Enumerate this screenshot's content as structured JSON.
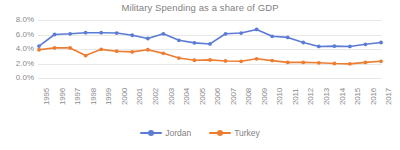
{
  "chart_data": {
    "type": "line",
    "title": "Military Spending as a share of GDP",
    "xlabel": "",
    "ylabel": "",
    "ylim": [
      0,
      8
    ],
    "yticks": [
      "0.0%",
      "2.0%",
      "4.0%",
      "6.0%",
      "8.0%"
    ],
    "ytick_values": [
      0,
      2,
      4,
      6,
      8
    ],
    "grid": true,
    "legend_position": "bottom",
    "categories": [
      "1995",
      "1996",
      "1997",
      "1998",
      "1999",
      "2000",
      "2001",
      "2002",
      "2003",
      "2004",
      "2005",
      "2006",
      "2007",
      "2008",
      "2009",
      "2010",
      "2011",
      "2012",
      "2013",
      "2014",
      "2015",
      "2016",
      "2017"
    ],
    "series": [
      {
        "name": "Jordan",
        "color": "#5B7BD5",
        "marker": "circle",
        "values": [
          4.4,
          6.0,
          6.1,
          6.25,
          6.25,
          6.2,
          5.9,
          5.45,
          6.1,
          5.2,
          4.85,
          4.7,
          6.1,
          6.2,
          6.7,
          5.75,
          5.6,
          4.9,
          4.35,
          4.4,
          4.35,
          4.65,
          4.9
        ]
      },
      {
        "name": "Turkey",
        "color": "#ED7D31",
        "marker": "circle",
        "values": [
          3.9,
          4.15,
          4.15,
          3.1,
          3.95,
          3.7,
          3.6,
          3.9,
          3.4,
          2.75,
          2.45,
          2.5,
          2.35,
          2.3,
          2.65,
          2.4,
          2.15,
          2.15,
          2.1,
          2.0,
          1.95,
          2.15,
          2.3
        ]
      }
    ]
  },
  "legend": {
    "entries": [
      {
        "label": "Jordan"
      },
      {
        "label": "Turkey"
      }
    ]
  },
  "colors": {
    "jordan": "#5B7BD5",
    "turkey": "#ED7D31",
    "gridline": "#e8e8e8",
    "text": "#7f7f7f",
    "background": "#ffffff"
  }
}
